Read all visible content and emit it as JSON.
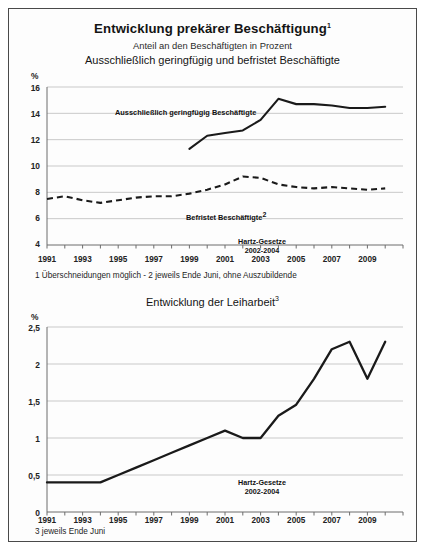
{
  "figure": {
    "title": "Entwicklung prekärer Beschäftigung",
    "title_sup": "1",
    "subtitle": "Anteil an den Beschäftigten in Prozent",
    "subtitle2": "Ausschließlich geringfügig und befristet Beschäftigte",
    "border_color": "#4a4a4a",
    "background": "#ffffff"
  },
  "chart1": {
    "unit_label": "%",
    "footnote": "1 Überschneidungen möglich  -  2 jeweils Ende Juni, ohne Auszubildende",
    "annotation": {
      "line1": "Hartz-Gesetze",
      "line2": "2002-2004"
    },
    "series_labels": {
      "solid": "Ausschließlich geringfügig Beschäftigte",
      "dashed": "Befristet Beschäftigte",
      "dashed_sup": "2"
    }
  },
  "chart2": {
    "title": "Entwicklung der Leiharbeit",
    "title_sup": "3",
    "unit_label": "%",
    "footnote": "3 jeweils Ende Juni",
    "annotation": {
      "line1": "Hartz-Gesetze",
      "line2": "2002-2004"
    }
  },
  "chart_data": [
    {
      "type": "line",
      "title": "Entwicklung prekärer Beschäftigung",
      "subtitle": "Anteil an den Beschäftigten in Prozent",
      "subtitle2": "Ausschließlich geringfügig und befristet Beschäftigte",
      "xlabel": "",
      "ylabel": "%",
      "ylim": [
        4,
        16
      ],
      "yticks": [
        4,
        6,
        8,
        10,
        12,
        14,
        16
      ],
      "ytick_labels": [
        "4",
        "6",
        "8",
        "10",
        "12",
        "14",
        "16"
      ],
      "xlim": [
        1991,
        2011
      ],
      "xticks": [
        1991,
        1993,
        1995,
        1997,
        1999,
        2001,
        2003,
        2005,
        2007,
        2009
      ],
      "xtick_labels": [
        "1991",
        "1993",
        "1995",
        "1997",
        "1999",
        "2001",
        "2003",
        "2005",
        "2007",
        "2009"
      ],
      "grid": true,
      "legend": "in-plot labels",
      "annotations": [
        {
          "text": "Hartz-Gesetze 2002-2004",
          "x": 2003,
          "y": 4.6
        }
      ],
      "series": [
        {
          "name": "Ausschließlich geringfügig Beschäftigte",
          "style": "solid",
          "color": "#1a1a1a",
          "x": [
            1999,
            2000,
            2001,
            2002,
            2003,
            2004,
            2005,
            2006,
            2007,
            2008,
            2009,
            2010
          ],
          "values": [
            11.3,
            12.3,
            12.5,
            12.7,
            13.5,
            15.1,
            14.7,
            14.7,
            14.6,
            14.4,
            14.4,
            14.5
          ]
        },
        {
          "name": "Befristet Beschäftigte",
          "style": "dashed",
          "color": "#1a1a1a",
          "x": [
            1991,
            1992,
            1993,
            1994,
            1995,
            1996,
            1997,
            1998,
            1999,
            2000,
            2001,
            2002,
            2003,
            2004,
            2005,
            2006,
            2007,
            2008,
            2009,
            2010
          ],
          "values": [
            7.5,
            7.7,
            7.4,
            7.2,
            7.4,
            7.6,
            7.7,
            7.7,
            7.9,
            8.2,
            8.6,
            9.2,
            9.1,
            8.6,
            8.4,
            8.3,
            8.4,
            8.3,
            8.2,
            8.3
          ]
        }
      ]
    },
    {
      "type": "line",
      "title": "Entwicklung der Leiharbeit",
      "xlabel": "",
      "ylabel": "%",
      "ylim": [
        0,
        2.5
      ],
      "yticks": [
        0,
        0.5,
        1,
        1.5,
        2,
        2.5
      ],
      "ytick_labels": [
        "0",
        "0,5",
        "1",
        "1,5",
        "2",
        "2,5"
      ],
      "xlim": [
        1991,
        2011
      ],
      "xticks": [
        1991,
        1993,
        1995,
        1997,
        1999,
        2001,
        2003,
        2005,
        2007,
        2009
      ],
      "xtick_labels": [
        "1991",
        "1993",
        "1995",
        "1997",
        "1999",
        "2001",
        "2003",
        "2005",
        "2007",
        "2009"
      ],
      "grid": true,
      "annotations": [
        {
          "text": "Hartz-Gesetze 2002-2004",
          "x": 2003,
          "y": 0.3
        }
      ],
      "series": [
        {
          "name": "Leiharbeit",
          "style": "solid",
          "color": "#1a1a1a",
          "x": [
            1991,
            1992,
            1993,
            1994,
            1995,
            1996,
            1997,
            1998,
            1999,
            2000,
            2001,
            2002,
            2003,
            2004,
            2005,
            2006,
            2007,
            2008,
            2009,
            2010
          ],
          "values": [
            0.4,
            0.4,
            0.4,
            0.4,
            0.5,
            0.6,
            0.7,
            0.8,
            0.9,
            1.0,
            1.1,
            1.0,
            1.0,
            1.3,
            1.45,
            1.8,
            2.2,
            2.3,
            1.8,
            2.3
          ]
        }
      ]
    }
  ]
}
